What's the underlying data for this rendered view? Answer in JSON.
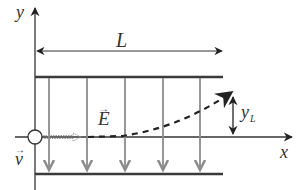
{
  "diagram": {
    "colors": {
      "axis": "#333333",
      "plate": "#3a3a3a",
      "field_arrow": "#8c8c8c",
      "trajectory": "#222222",
      "velocity_arrow": "#9a9a9a"
    },
    "labels": {
      "y_axis": "y",
      "x_axis": "x",
      "plate_length": "L",
      "field": "E",
      "velocity": "v",
      "deflection": "y",
      "deflection_sub": "L",
      "vector_arrow": "→"
    },
    "field_arrow_count": 5
  }
}
